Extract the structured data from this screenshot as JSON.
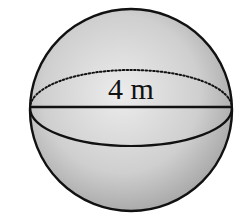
{
  "diagram": {
    "type": "sphere",
    "label": "4 m",
    "dimension_shown": "diameter",
    "colors": {
      "fill_light": "#e4e4e4",
      "fill_dark": "#9a9a9a",
      "stroke": "#111111",
      "background": "#ffffff"
    }
  }
}
